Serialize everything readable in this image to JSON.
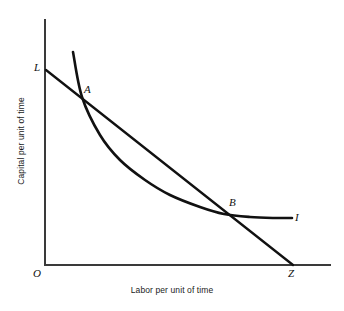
{
  "figure": {
    "background_color": "#ffffff",
    "width": 344,
    "height": 311
  },
  "axes": {
    "x_title": "Labor per unit of time",
    "y_title": "Capital per unit of time",
    "origin_label": "O",
    "color": "#3a3a3a",
    "x_start": [
      45,
      265
    ],
    "x_end": [
      330,
      265
    ],
    "y_start": [
      45,
      20
    ],
    "y_end": [
      45,
      265
    ]
  },
  "labels": {
    "isocost_top": "L",
    "point_a": "A",
    "point_b": "B",
    "isoquant": "I",
    "origin": "O",
    "isocost_bottom": "Z"
  },
  "chart_data": {
    "type": "line",
    "title": "",
    "xlabel": "Labor per unit of time",
    "ylabel": "Capital per unit of time",
    "grid": false,
    "legend": "none",
    "axis_style": "schematic-unscaled",
    "series": [
      {
        "name": "isocost-line",
        "label": "LZ",
        "shape": "straight",
        "endpoint_labels": [
          "L",
          "Z"
        ],
        "color": "#111111",
        "width": 2.3,
        "points": [
          [
            46,
            70
          ],
          [
            293,
            265
          ]
        ]
      },
      {
        "name": "isoquant-curve",
        "label": "I",
        "shape": "convex-to-origin",
        "endpoint_labels": [
          "",
          "I"
        ],
        "color": "#111111",
        "width": 2.6,
        "points": [
          [
            73,
            52
          ],
          [
            82,
            97
          ],
          [
            100,
            135
          ],
          [
            120,
            160
          ],
          [
            145,
            180
          ],
          [
            170,
            195
          ],
          [
            200,
            207
          ],
          [
            224,
            214
          ],
          [
            250,
            217
          ],
          [
            275,
            218
          ],
          [
            292,
            218
          ]
        ]
      }
    ],
    "annotations": [
      {
        "text": "L",
        "x": 46,
        "y": 70,
        "role": "isocost-intercept"
      },
      {
        "text": "A",
        "x": 82,
        "y": 97,
        "role": "intersection-upper"
      },
      {
        "text": "B",
        "x": 224,
        "y": 214,
        "role": "intersection-lower"
      },
      {
        "text": "I",
        "x": 292,
        "y": 218,
        "role": "isoquant-end"
      },
      {
        "text": "O",
        "x": 45,
        "y": 265,
        "role": "origin"
      },
      {
        "text": "Z",
        "x": 293,
        "y": 265,
        "role": "isocost-intercept"
      }
    ]
  }
}
